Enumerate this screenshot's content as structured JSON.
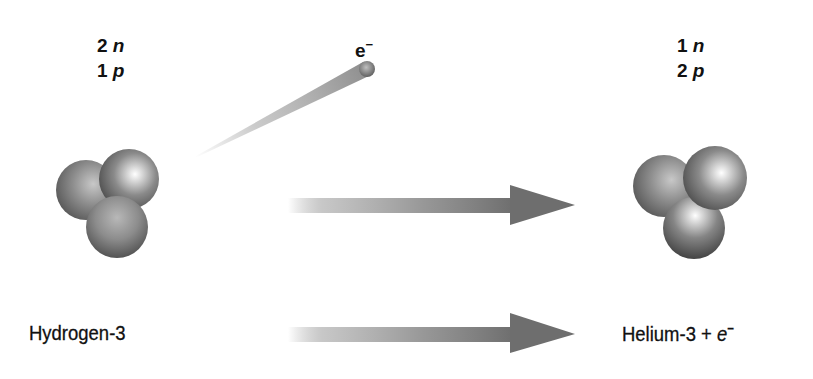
{
  "diagram": {
    "reactant": {
      "neutron_count": "2",
      "neutron_symbol": "n",
      "proton_count": "1",
      "proton_symbol": "p",
      "name": "Hydrogen-3",
      "nucleons": [
        {
          "type": "particle",
          "cx": 86,
          "cy": 190,
          "r": 30
        },
        {
          "type": "particle",
          "cx": 129,
          "cy": 179,
          "r": 30
        },
        {
          "type": "particle",
          "cx": 117,
          "cy": 227,
          "r": 30
        }
      ]
    },
    "emitted": {
      "symbol": "e",
      "charge": "−",
      "label": "e⁻"
    },
    "product": {
      "neutron_count": "1",
      "neutron_symbol": "n",
      "proton_count": "2",
      "proton_symbol": "p",
      "name": "Helium-3",
      "plus": "+",
      "electron_symbol": "e",
      "electron_charge": "−"
    },
    "colors": {
      "sphere_dark": "#4a4a4a",
      "sphere_mid": "#8a8a8a",
      "sphere_light": "#f4f4f4",
      "arrow": "#6e6e6e",
      "text": "#111111",
      "background": "#ffffff"
    }
  }
}
